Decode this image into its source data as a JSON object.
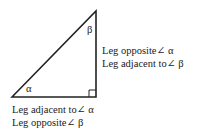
{
  "diagram": {
    "angles": {
      "alpha": "α",
      "beta": "β"
    },
    "right_leg_labels": [
      "Leg opposite∠ α",
      "Leg adjacent to∠ β"
    ],
    "bottom_leg_labels": [
      "Leg adjacent to∠ α",
      "Leg opposite∠ β"
    ],
    "colors": {
      "stroke": "#222222",
      "background": "#ffffff"
    }
  }
}
